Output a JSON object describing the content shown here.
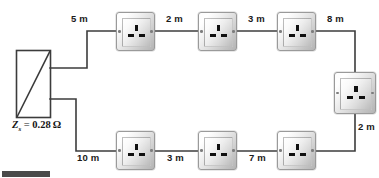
{
  "diagram": {
    "width": 379,
    "height": 178,
    "background_color": "#ffffff",
    "line_color": "#3c3c3c",
    "label_color": "#1a1a1a"
  },
  "supply": {
    "name": "supply-source-box",
    "impedance_label_symbol": "Z",
    "impedance_label_subscript": "s",
    "impedance_label_equals": " = ",
    "impedance_label_value": "0.28",
    "impedance_label_unit": "Ω",
    "impedance_label_full": "Zs = 0.28 Ω"
  },
  "dimensions": {
    "top": [
      {
        "id": "seg-5m",
        "label": "5 m",
        "x": 71,
        "y": 13
      },
      {
        "id": "seg-2m",
        "label": "2 m",
        "x": 166,
        "y": 13
      },
      {
        "id": "seg-3m",
        "label": "3 m",
        "x": 248,
        "y": 13
      },
      {
        "id": "seg-8m",
        "label": "8 m",
        "x": 327,
        "y": 13
      }
    ],
    "right": [
      {
        "id": "seg-2m-right",
        "label": "2 m",
        "x": 358,
        "y": 121
      }
    ],
    "bottom": [
      {
        "id": "seg-10m",
        "label": "10 m",
        "x": 77,
        "y": 152
      },
      {
        "id": "seg-3m-bottom",
        "label": "3 m",
        "x": 167,
        "y": 152
      },
      {
        "id": "seg-7m",
        "label": "7 m",
        "x": 249,
        "y": 152
      }
    ]
  },
  "sockets": [
    {
      "id": "socket-top-1",
      "name": "socket-outlet",
      "x": 116,
      "y": 12,
      "w": 39,
      "h": 39
    },
    {
      "id": "socket-top-2",
      "name": "socket-outlet",
      "x": 198,
      "y": 12,
      "w": 39,
      "h": 39
    },
    {
      "id": "socket-top-3",
      "name": "socket-outlet",
      "x": 277,
      "y": 12,
      "w": 39,
      "h": 39
    },
    {
      "id": "socket-right-1",
      "name": "socket-outlet",
      "x": 334,
      "y": 72,
      "w": 42,
      "h": 42
    },
    {
      "id": "socket-bottom-1",
      "name": "socket-outlet",
      "x": 116,
      "y": 131,
      "w": 39,
      "h": 39
    },
    {
      "id": "socket-bottom-2",
      "name": "socket-outlet",
      "x": 198,
      "y": 131,
      "w": 39,
      "h": 39
    },
    {
      "id": "socket-bottom-3",
      "name": "socket-outlet",
      "x": 277,
      "y": 131,
      "w": 39,
      "h": 39
    }
  ],
  "socket_pins": {
    "earth": "earth-pin",
    "live": "live-pin",
    "neutral": "neutral-pin"
  }
}
